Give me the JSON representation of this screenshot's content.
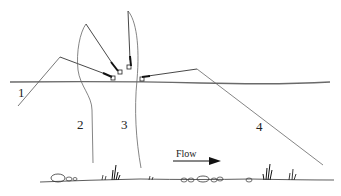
{
  "diagram": {
    "type": "illustration",
    "labels": [
      {
        "id": "1",
        "text": "1",
        "x": 18,
        "y": 86
      },
      {
        "id": "2",
        "text": "2",
        "x": 77,
        "y": 118
      },
      {
        "id": "3",
        "text": "3",
        "x": 121,
        "y": 118
      },
      {
        "id": "4",
        "text": "4",
        "x": 256,
        "y": 120
      }
    ],
    "flow": {
      "text": "Flow",
      "direction": "right"
    },
    "colors": {
      "line": "#333333",
      "water_surface": "#555555",
      "rod": "#222222",
      "background": "#ffffff"
    },
    "elements": {
      "water_surface": "horizontal line across the diagram",
      "riverbed": "irregular bottom with stones and weeds",
      "rods": 4
    }
  }
}
